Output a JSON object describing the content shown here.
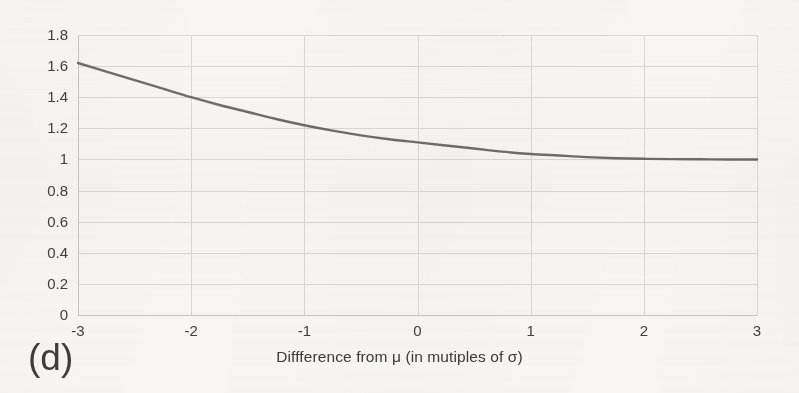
{
  "figure": {
    "subfigure_label": "(d)",
    "background_color": "#f7f6f4",
    "curve_color": "#5a5a5a",
    "gridline_color": "#d8d8d6",
    "axis_color": "#c6c6c4",
    "text_color": "#3a3a3a"
  },
  "chart_data": {
    "type": "line",
    "title": "",
    "subtitle": "",
    "xlabel": "Diffference from μ  (in mutiples of σ)",
    "ylabel": "",
    "xlim": [
      -3,
      3
    ],
    "ylim": [
      0,
      1.8
    ],
    "grid": true,
    "legend_position": "none",
    "x_tick_labels": [
      "-3",
      "-2",
      "-1",
      "0",
      "1",
      "2",
      "3"
    ],
    "x_ticks": [
      -3,
      -2,
      -1,
      0,
      1,
      2,
      3
    ],
    "y_tick_labels": [
      "1.8",
      "1.6",
      "1.4",
      "1.2",
      "1",
      "0.8",
      "0.6",
      "0.4",
      "0.2",
      "0"
    ],
    "y_ticks": [
      1.8,
      1.6,
      1.4,
      1.2,
      1.0,
      0.8,
      0.6,
      0.4,
      0.2,
      0
    ],
    "series": [
      {
        "name": "ratio",
        "color": "#5a5a5a",
        "x": [
          -3.0,
          -2.75,
          -2.5,
          -2.25,
          -2.0,
          -1.75,
          -1.5,
          -1.25,
          -1.0,
          -0.75,
          -0.5,
          -0.25,
          0.0,
          0.25,
          0.5,
          0.75,
          1.0,
          1.25,
          1.5,
          1.75,
          2.0,
          2.25,
          2.5,
          2.75,
          3.0
        ],
        "values": [
          1.62,
          1.565,
          1.51,
          1.455,
          1.4,
          1.35,
          1.305,
          1.26,
          1.22,
          1.185,
          1.155,
          1.13,
          1.11,
          1.09,
          1.07,
          1.05,
          1.035,
          1.025,
          1.015,
          1.008,
          1.004,
          1.002,
          1.001,
          1.0,
          1.0
        ]
      }
    ]
  }
}
